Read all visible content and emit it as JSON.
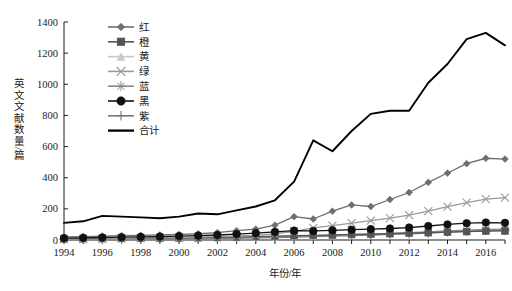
{
  "chart_data": {
    "type": "line",
    "title": "",
    "xlabel": "年份/年",
    "ylabel": "英文文献数量/篇",
    "xlim": [
      1994,
      2017
    ],
    "ylim": [
      0,
      1400
    ],
    "ytick_step": 200,
    "grid": false,
    "legend_position": "top-left-inside",
    "x": [
      1994,
      1995,
      1996,
      1997,
      1998,
      1999,
      2000,
      2001,
      2002,
      2003,
      2004,
      2005,
      2006,
      2007,
      2008,
      2009,
      2010,
      2011,
      2012,
      2013,
      2014,
      2015,
      2016,
      2017
    ],
    "xtick_labels": [
      "1994",
      "1996",
      "1998",
      "2000",
      "2002",
      "2004",
      "2006",
      "2008",
      "2010",
      "2012",
      "2014",
      "2016"
    ],
    "ytick_labels": [
      "0",
      "200",
      "400",
      "600",
      "800",
      "1000",
      "1200",
      "1400"
    ],
    "series": [
      {
        "name": "红",
        "marker": "diamond",
        "color": "#6e6e6e",
        "values": [
          20,
          22,
          25,
          28,
          30,
          32,
          36,
          40,
          48,
          60,
          70,
          95,
          150,
          135,
          185,
          225,
          215,
          260,
          305,
          370,
          430,
          490,
          525,
          520
        ]
      },
      {
        "name": "橙",
        "marker": "square",
        "color": "#555555",
        "values": [
          8,
          9,
          10,
          11,
          12,
          13,
          14,
          15,
          17,
          19,
          22,
          25,
          28,
          30,
          33,
          36,
          38,
          41,
          44,
          47,
          50,
          54,
          57,
          58
        ]
      },
      {
        "name": "黄",
        "marker": "triangle",
        "color": "#c8c8c8",
        "values": [
          5,
          6,
          7,
          8,
          9,
          10,
          11,
          12,
          14,
          16,
          18,
          21,
          24,
          27,
          30,
          34,
          38,
          42,
          46,
          50,
          55,
          60,
          64,
          66
        ]
      },
      {
        "name": "绿",
        "marker": "x",
        "color": "#9a9a9a",
        "values": [
          6,
          7,
          9,
          10,
          12,
          14,
          16,
          19,
          22,
          26,
          30,
          40,
          55,
          78,
          92,
          108,
          125,
          140,
          160,
          185,
          215,
          240,
          262,
          272
        ]
      },
      {
        "name": "蓝",
        "marker": "asterisk",
        "color": "#8a8a8a",
        "values": [
          4,
          5,
          6,
          7,
          8,
          9,
          10,
          11,
          13,
          15,
          17,
          20,
          23,
          26,
          30,
          34,
          38,
          42,
          47,
          52,
          58,
          63,
          68,
          70
        ]
      },
      {
        "name": "黑",
        "marker": "circle",
        "color": "#111111",
        "values": [
          12,
          14,
          16,
          18,
          20,
          22,
          25,
          28,
          32,
          38,
          44,
          52,
          60,
          58,
          62,
          66,
          70,
          74,
          80,
          90,
          100,
          108,
          112,
          110
        ]
      },
      {
        "name": "紫",
        "marker": "plus",
        "color": "#777777",
        "values": [
          3,
          4,
          4,
          5,
          6,
          7,
          8,
          9,
          10,
          12,
          14,
          16,
          19,
          22,
          25,
          28,
          32,
          36,
          40,
          45,
          50,
          55,
          60,
          62
        ]
      },
      {
        "name": "合计",
        "marker": "none",
        "color": "#000000",
        "values": [
          110,
          120,
          155,
          150,
          145,
          140,
          150,
          170,
          165,
          190,
          215,
          255,
          375,
          640,
          570,
          700,
          810,
          830,
          830,
          1010,
          1130,
          1290,
          1330,
          1250
        ]
      }
    ]
  },
  "axes": {
    "y_title": "英文文献数量/篇",
    "x_title": "年份/年"
  },
  "legend": {
    "items": [
      {
        "label": "红"
      },
      {
        "label": "橙"
      },
      {
        "label": "黄"
      },
      {
        "label": "绿"
      },
      {
        "label": "蓝"
      },
      {
        "label": "黑"
      },
      {
        "label": "紫"
      },
      {
        "label": "合计"
      }
    ]
  }
}
